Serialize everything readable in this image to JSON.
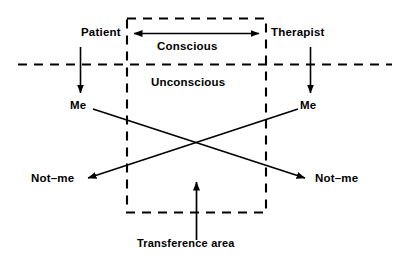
{
  "diagram": {
    "stroke_color": "#000000",
    "background_color": "#ffffff",
    "labels": {
      "patient": "Patient",
      "therapist": "Therapist",
      "conscious": "Conscious",
      "unconscious": "Unconscious",
      "me_left": "Me",
      "me_right": "Me",
      "notme_left": "Not–me",
      "notme_right": "Not–me",
      "transference": "Transference  area"
    },
    "elements": {
      "transference_box": "dashed rectangle enclosing transference area",
      "conscious_unconscious_divider": "horizontal dashed line",
      "conscious_arrow": "double headed horizontal arrow between patient and therapist",
      "patient_arrow": "downward arrow from Patient to Me",
      "therapist_arrow": "downward arrow from Therapist to Me",
      "cross_line_left": "arrow from patient Me to therapist-side Not-me",
      "cross_line_right": "arrow from therapist Me to patient-side Not-me",
      "transference_arrow": "upward arrow from Transference area label into box"
    }
  }
}
